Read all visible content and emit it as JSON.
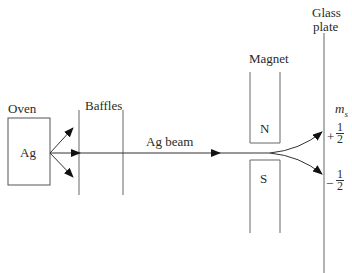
{
  "diagram": {
    "labels": {
      "oven": "Oven",
      "element": "Ag",
      "baffles": "Baffles",
      "beam": "Ag beam",
      "magnet": "Magnet",
      "north": "N",
      "south": "S",
      "glass_line1": "Glass",
      "glass_line2": "plate",
      "ms": "m",
      "ms_sub": "s",
      "plus_sign": "+",
      "minus_sign": "−",
      "frac_num": "1",
      "frac_den": "2"
    },
    "colors": {
      "line": "#444444",
      "arrow": "#111111"
    }
  }
}
